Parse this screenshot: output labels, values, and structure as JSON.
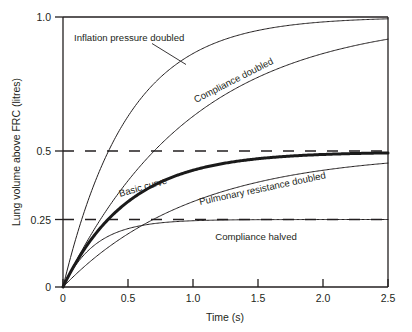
{
  "chart_data": {
    "type": "line",
    "title": "",
    "xlabel": "Time (s)",
    "ylabel": "Lung volume above FRC (litres)",
    "xlim": [
      0,
      2.5
    ],
    "ylim": [
      0,
      1.0
    ],
    "xticks": [
      "0",
      "0.5",
      "1.0",
      "1.5",
      "2.0",
      "2.5"
    ],
    "xtick_values": [
      0,
      0.5,
      1.0,
      1.5,
      2.0,
      2.5
    ],
    "yticks": [
      "0",
      "0.25",
      "0.5",
      "1.0"
    ],
    "ytick_values": [
      0,
      0.25,
      0.5,
      1.0
    ],
    "grid": "dashed horizontal reference lines at 0.25 and 0.5",
    "gridlines": [
      0.25,
      0.5
    ],
    "legend": "inline curve annotations",
    "series": [
      {
        "name": "Inflation pressure doubled",
        "label": "Inflation pressure doubled",
        "plateau": 1.0,
        "time_constant": 0.5,
        "linewidth": 1,
        "color": "#231f20",
        "x": [
          0,
          0.1,
          0.25,
          0.5,
          0.75,
          1.0,
          1.25,
          1.5,
          1.75,
          2.0,
          2.25,
          2.5
        ],
        "y": [
          0,
          0.181,
          0.393,
          0.632,
          0.777,
          0.865,
          0.918,
          0.95,
          0.97,
          0.982,
          0.989,
          0.993
        ]
      },
      {
        "name": "Compliance doubled",
        "label": "Compliance doubled",
        "plateau": 1.0,
        "time_constant": 1.0,
        "linewidth": 1,
        "color": "#231f20",
        "x": [
          0,
          0.1,
          0.25,
          0.5,
          0.75,
          1.0,
          1.25,
          1.5,
          1.75,
          2.0,
          2.25,
          2.5
        ],
        "y": [
          0,
          0.095,
          0.221,
          0.393,
          0.528,
          0.632,
          0.713,
          0.777,
          0.826,
          0.865,
          0.895,
          0.918
        ]
      },
      {
        "name": "Basic curve",
        "label": "Basic curve",
        "plateau": 0.5,
        "time_constant": 0.5,
        "linewidth": 3,
        "color": "#1a1a1a",
        "x": [
          0,
          0.1,
          0.25,
          0.5,
          0.75,
          1.0,
          1.25,
          1.5,
          1.75,
          2.0,
          2.25,
          2.5
        ],
        "y": [
          0,
          0.091,
          0.197,
          0.316,
          0.388,
          0.432,
          0.459,
          0.475,
          0.485,
          0.491,
          0.495,
          0.497
        ]
      },
      {
        "name": "Pulmonary resistance doubled",
        "label": "Pulmonary resistance doubled",
        "plateau": 0.5,
        "time_constant": 1.0,
        "linewidth": 1,
        "color": "#231f20",
        "x": [
          0,
          0.1,
          0.25,
          0.5,
          0.75,
          1.0,
          1.25,
          1.5,
          1.75,
          2.0,
          2.25,
          2.5
        ],
        "y": [
          0,
          0.048,
          0.111,
          0.197,
          0.264,
          0.316,
          0.357,
          0.388,
          0.413,
          0.432,
          0.447,
          0.459
        ]
      },
      {
        "name": "Compliance halved",
        "label": "Compliance halved",
        "plateau": 0.25,
        "time_constant": 0.25,
        "linewidth": 1,
        "color": "#231f20",
        "x": [
          0,
          0.1,
          0.25,
          0.5,
          0.75,
          1.0,
          1.25,
          1.5,
          1.75,
          2.0,
          2.25,
          2.5
        ],
        "y": [
          0,
          0.083,
          0.158,
          0.216,
          0.238,
          0.245,
          0.248,
          0.249,
          0.2495,
          0.25,
          0.25,
          0.25
        ]
      }
    ],
    "annotations": [
      {
        "text": "Inflation pressure doubled",
        "rotation": 0,
        "leader_line": true,
        "points_to_series": "Inflation pressure doubled"
      },
      {
        "text": "Compliance doubled",
        "rotation": -27,
        "leader_line": false
      },
      {
        "text": "Basic curve",
        "rotation": -16,
        "leader_line": false
      },
      {
        "text": "Pulmonary resistance doubled",
        "rotation": -12,
        "leader_line": false
      },
      {
        "text": "Compliance halved",
        "rotation": 0,
        "leader_line": false
      }
    ],
    "colors": {
      "axis": "#231f20",
      "curve": "#231f20",
      "emphasis_curve": "#1a1a1a",
      "gridline": "#231f20",
      "background": "#ffffff"
    }
  }
}
